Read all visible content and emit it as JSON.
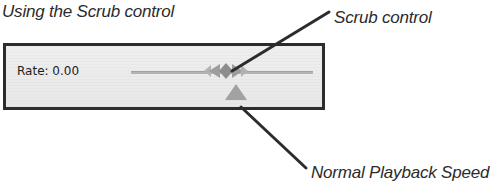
{
  "figure": {
    "title": "Using the Scrub control"
  },
  "control_panel": {
    "rate_label": "Rate: 0.00",
    "rate_value": "0.00",
    "scrub_handle_icon": "double-arrow-scrub-icon",
    "speed_marker_icon": "triangle-marker-icon",
    "track_position_percent": 55
  },
  "callouts": [
    {
      "id": "scrub-control",
      "label": "Scrub control",
      "target": "scrub-handle"
    },
    {
      "id": "normal-playback-speed",
      "label": "Normal Playback Speed",
      "target": "speed-marker"
    }
  ],
  "colors": {
    "panel_background": "#ececec",
    "panel_border": "#2c2c2c",
    "track": "#b4b4b4",
    "handle_gray": "#a8a8a8",
    "handle_gray_dark": "#8f8f8f",
    "marker_gray": "#a0a0a0",
    "text": "#2b2b2b",
    "leader_line": "#2c2c2c",
    "page_background": "#ffffff"
  }
}
